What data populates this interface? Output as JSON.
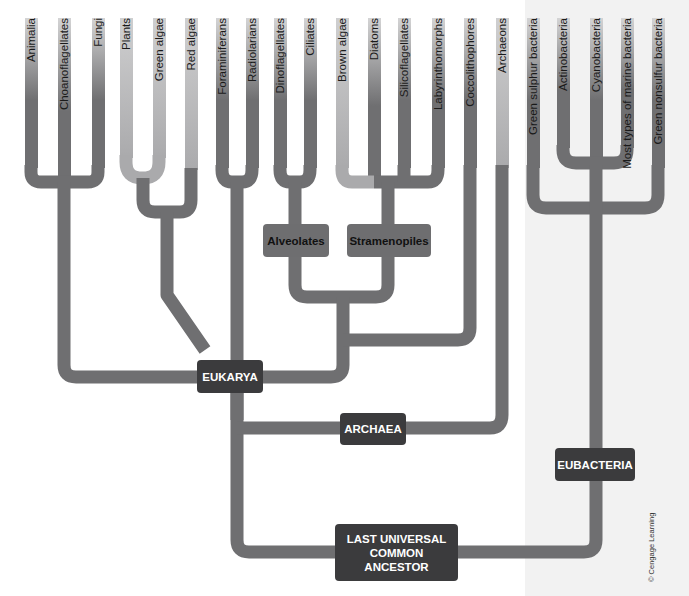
{
  "leaves": [
    {
      "label": "Animalia"
    },
    {
      "label": "Choanoflagellates"
    },
    {
      "label": "Fungi"
    },
    {
      "label": "Plants"
    },
    {
      "label": "Green algae"
    },
    {
      "label": "Red algae"
    },
    {
      "label": "Foraminiferans"
    },
    {
      "label": "Radiolarians"
    },
    {
      "label": "Dinoflagellates"
    },
    {
      "label": "Ciliates"
    },
    {
      "label": "Brown algae"
    },
    {
      "label": "Diatoms"
    },
    {
      "label": "Silicoflagellates"
    },
    {
      "label": "Labyrinthomorphs"
    },
    {
      "label": "Coccolithophores"
    },
    {
      "label": "Archaeons"
    },
    {
      "label": "Green sulphur bacteria"
    },
    {
      "label": "Actinobacteria"
    },
    {
      "label": "Cyanobacteria"
    },
    {
      "label": "Most types of marine bacteria"
    },
    {
      "label": "Green nonsulfur bacteria"
    }
  ],
  "nodes": {
    "alveolates": "Alveolates",
    "stramenopiles": "Stramenopiles",
    "eukarya": "EUKARYA",
    "archaea": "ARCHAEA",
    "eubacteria": "EUBACTERIA",
    "luca": "LAST UNIVERSAL\nCOMMON\nANCESTOR"
  },
  "credit": "© Cengage Learning",
  "colors": {
    "branch": "#6f6f71",
    "branch_light": "#aaaaac",
    "node_dark": "#3b3b3d",
    "node_mid": "#6e6e70"
  }
}
